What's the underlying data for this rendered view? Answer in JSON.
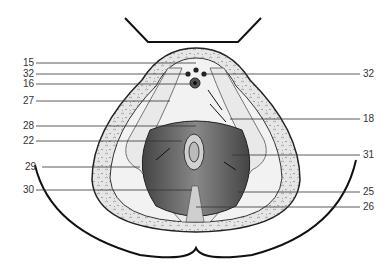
{
  "figure": {
    "labels_left": [
      "15",
      "32",
      "16",
      "27",
      "28",
      "22",
      "29",
      "30"
    ],
    "labels_right": [
      "32",
      "18",
      "31",
      "25",
      "26"
    ]
  }
}
